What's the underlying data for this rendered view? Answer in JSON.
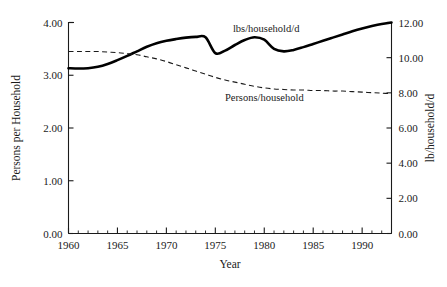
{
  "chart_data": {
    "type": "line",
    "title": "",
    "subtitle": "",
    "xlabel": "Year",
    "ylabel": "Persons per Household",
    "y2label": "lb/household/d",
    "xlim": [
      1960,
      1993
    ],
    "ylim": [
      0.0,
      4.0
    ],
    "y2lim": [
      0.0,
      12.0
    ],
    "grid": false,
    "legend_position": "inline-annotations",
    "x_ticks": [
      1960,
      1965,
      1970,
      1975,
      1980,
      1985,
      1990
    ],
    "x_tick_labels": [
      "1960",
      "1965",
      "1970",
      "1975",
      "1980",
      "1985",
      "1990"
    ],
    "x_minor_tick_step": 1,
    "y_ticks": [
      0.0,
      1.0,
      2.0,
      3.0,
      4.0
    ],
    "y_tick_labels": [
      "0.00",
      "1.00",
      "2.00",
      "3.00",
      "4.00"
    ],
    "y2_ticks": [
      0.0,
      2.0,
      4.0,
      6.0,
      8.0,
      10.0,
      12.0
    ],
    "y2_tick_labels": [
      "0.00",
      "2.00",
      "4.00",
      "6.00",
      "8.00",
      "10.00",
      "12.00"
    ],
    "annotations": [
      {
        "text": "lbs/household/d",
        "x": 1980.2,
        "y": 3.82,
        "axis": "left"
      },
      {
        "text": "Persons/household",
        "x": 1980.0,
        "y": 2.52,
        "axis": "left"
      }
    ],
    "series": [
      {
        "name": "lbs/household/d",
        "axis": "right",
        "style": "solid",
        "color": "#000000",
        "x": [
          1960,
          1961,
          1962,
          1963,
          1964,
          1965,
          1966,
          1967,
          1968,
          1969,
          1970,
          1971,
          1972,
          1973,
          1974,
          1975,
          1976,
          1977,
          1978,
          1979,
          1980,
          1981,
          1982,
          1983,
          1984,
          1985,
          1986,
          1987,
          1988,
          1989,
          1990,
          1991,
          1992,
          1993
        ],
        "values": [
          9.4,
          9.38,
          9.4,
          9.48,
          9.64,
          9.86,
          10.1,
          10.36,
          10.62,
          10.82,
          10.96,
          11.06,
          11.14,
          11.18,
          11.16,
          10.26,
          10.4,
          10.72,
          11.0,
          11.16,
          11.02,
          10.5,
          10.36,
          10.44,
          10.6,
          10.78,
          10.96,
          11.14,
          11.32,
          11.5,
          11.66,
          11.8,
          11.92,
          12.0
        ]
      },
      {
        "name": "Persons/household",
        "axis": "left",
        "style": "dashed",
        "color": "#1a1a1a",
        "x": [
          1960,
          1961,
          1962,
          1963,
          1964,
          1965,
          1966,
          1967,
          1968,
          1969,
          1970,
          1971,
          1972,
          1973,
          1974,
          1975,
          1976,
          1977,
          1978,
          1979,
          1980,
          1981,
          1982,
          1983,
          1984,
          1985,
          1986,
          1987,
          1988,
          1989,
          1990,
          1991,
          1992,
          1993
        ],
        "values": [
          3.45,
          3.45,
          3.45,
          3.45,
          3.44,
          3.43,
          3.41,
          3.39,
          3.35,
          3.31,
          3.26,
          3.2,
          3.14,
          3.08,
          3.02,
          2.96,
          2.91,
          2.87,
          2.83,
          2.79,
          2.76,
          2.74,
          2.73,
          2.72,
          2.72,
          2.71,
          2.71,
          2.7,
          2.7,
          2.69,
          2.68,
          2.67,
          2.66,
          2.65
        ]
      }
    ]
  }
}
